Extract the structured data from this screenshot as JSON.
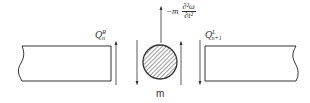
{
  "diagram": {
    "type": "free-body diagram of lumped mass between beam segments",
    "labels": {
      "left_shear": {
        "base": "Q",
        "sup": "R",
        "sub": "n"
      },
      "right_shear": {
        "base": "Q",
        "sup": "L",
        "sub": "n+1"
      },
      "inertia_force": {
        "prefix": "−m",
        "numerator": "∂²ω",
        "denominator": "∂t²"
      },
      "mass": "m"
    },
    "colors": {
      "stroke": "#333333",
      "hatch": "#555555",
      "background": "#ffffff"
    }
  }
}
